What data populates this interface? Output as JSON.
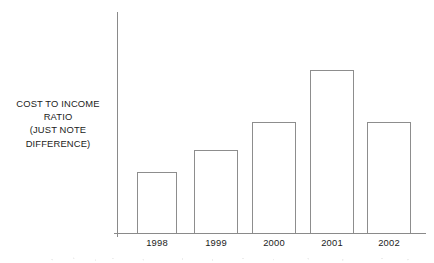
{
  "chart_data": {
    "type": "bar",
    "title": "",
    "subtitle": "",
    "xlabel": "",
    "ylabel": "COST TO INCOME RATIO (JUST NOTE DIFFERENCE)",
    "ylabel_lines": [
      "COST TO INCOME",
      "RATIO",
      "(JUST NOTE",
      "DIFFERENCE)"
    ],
    "categories": [
      "1998",
      "1999",
      "2000",
      "2001",
      "2002"
    ],
    "values": [
      61,
      83,
      111,
      163,
      111
    ],
    "ylim": [
      0,
      221
    ],
    "y_ticks": [],
    "y_tick_labels": [],
    "grid": false,
    "legend": null,
    "annotations": [],
    "series": [
      {
        "name": "Cost to income ratio",
        "values": [
          61,
          83,
          111,
          163,
          111
        ]
      }
    ],
    "bar_style": {
      "fill": "#ffffff",
      "outline": "#8d8d8d",
      "outline_width_px": 1
    },
    "axis_color": "#8a8a8a",
    "background": "#ffffff",
    "text_color": "#1b1b1b",
    "geometry": {
      "baseline_y": 233,
      "y_axis_x": 117,
      "y_axis_top": 12,
      "plot_right": 426,
      "bars": [
        {
          "label": "1998",
          "left": 137,
          "width": 40,
          "top": 172,
          "height": 61
        },
        {
          "label": "1999",
          "left": 194,
          "width": 44,
          "top": 150,
          "height": 83
        },
        {
          "label": "2000",
          "left": 252,
          "width": 44,
          "top": 122,
          "height": 111
        },
        {
          "label": "2001",
          "left": 310,
          "width": 44,
          "top": 70,
          "height": 163
        },
        {
          "label": "2002",
          "left": 367,
          "width": 44,
          "top": 122,
          "height": 111
        }
      ]
    }
  }
}
